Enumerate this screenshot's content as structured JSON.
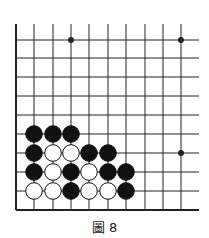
{
  "caption": "圖 8",
  "board": {
    "line_color": "#222222",
    "stone_black": "#111111",
    "stone_white": "#ffffff",
    "columns_x": [
      16,
      34,
      53,
      71,
      89,
      108,
      126,
      145,
      163,
      181
    ],
    "rows_y": [
      40,
      58,
      77,
      96,
      115,
      134,
      153,
      172,
      191,
      210
    ],
    "edges": [
      "left",
      "bottom"
    ],
    "star_points": [
      {
        "col": 3,
        "row": 0
      },
      {
        "col": 9,
        "row": 0
      },
      {
        "col": 9,
        "row": 6
      }
    ],
    "stones": [
      {
        "col": 1,
        "row": 5,
        "color": "black"
      },
      {
        "col": 2,
        "row": 5,
        "color": "black"
      },
      {
        "col": 3,
        "row": 5,
        "color": "black"
      },
      {
        "col": 1,
        "row": 6,
        "color": "black"
      },
      {
        "col": 2,
        "row": 6,
        "color": "white"
      },
      {
        "col": 3,
        "row": 6,
        "color": "white"
      },
      {
        "col": 4,
        "row": 6,
        "color": "black"
      },
      {
        "col": 5,
        "row": 6,
        "color": "black"
      },
      {
        "col": 1,
        "row": 7,
        "color": "black"
      },
      {
        "col": 2,
        "row": 7,
        "color": "white"
      },
      {
        "col": 3,
        "row": 7,
        "color": "black"
      },
      {
        "col": 4,
        "row": 7,
        "color": "white"
      },
      {
        "col": 5,
        "row": 7,
        "color": "black"
      },
      {
        "col": 6,
        "row": 7,
        "color": "black"
      },
      {
        "col": 1,
        "row": 8,
        "color": "white"
      },
      {
        "col": 2,
        "row": 8,
        "color": "white"
      },
      {
        "col": 3,
        "row": 8,
        "color": "black"
      },
      {
        "col": 4,
        "row": 8,
        "color": "white"
      },
      {
        "col": 5,
        "row": 8,
        "color": "white"
      },
      {
        "col": 6,
        "row": 8,
        "color": "black"
      }
    ]
  }
}
